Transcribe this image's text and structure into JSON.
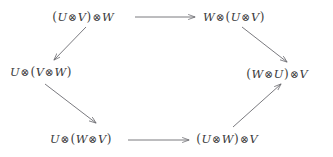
{
  "diagram": {
    "type": "commutative-hexagon",
    "title": "",
    "background_color": "#ffffff",
    "text_color": "#3a3a3c",
    "arrow_color": "#6b6b70",
    "tensor_symbol": "⊗",
    "nodes": [
      {
        "id": "top-left",
        "label": "(U⊗V)⊗W",
        "parts": [
          "(",
          "U",
          "⊗",
          "V",
          ")",
          "⊗",
          "W"
        ],
        "x": 52,
        "y": 11
      },
      {
        "id": "top-right",
        "label": "W⊗(U⊗V)",
        "parts": [
          "W",
          "⊗",
          "(",
          "U",
          "⊗",
          "V",
          ")"
        ],
        "x": 203,
        "y": 11
      },
      {
        "id": "middle-left",
        "label": "U⊗(V⊗W)",
        "parts": [
          "U",
          "⊗",
          "(",
          "V",
          "⊗",
          "W",
          ")"
        ],
        "x": 10,
        "y": 66
      },
      {
        "id": "middle-right",
        "label": "(W⊗U)⊗V",
        "parts": [
          "(",
          "W",
          "⊗",
          "U",
          ")",
          "⊗",
          "V"
        ],
        "x": 246,
        "y": 68
      },
      {
        "id": "bottom-left",
        "label": "U⊗(W⊗V)",
        "parts": [
          "U",
          "⊗",
          "(",
          "W",
          "⊗",
          "V",
          ")"
        ],
        "x": 50,
        "y": 133
      },
      {
        "id": "bottom-right",
        "label": "(U⊗W)⊗V",
        "parts": [
          "(",
          "U",
          "⊗",
          "W",
          ")",
          "⊗",
          "V"
        ],
        "x": 196,
        "y": 133
      }
    ],
    "arrows": [
      {
        "id": "arrow-top",
        "from": "top-left",
        "to": "top-right",
        "label": "",
        "x1": 135,
        "y1": 17,
        "x2": 196,
        "y2": 17
      },
      {
        "id": "arrow-top-left-down",
        "from": "top-left",
        "to": "middle-left",
        "label": "",
        "x1": 85,
        "y1": 26,
        "x2": 53,
        "y2": 60
      },
      {
        "id": "arrow-top-right-down",
        "from": "top-right",
        "to": "middle-right",
        "label": "",
        "x1": 242,
        "y1": 26,
        "x2": 288,
        "y2": 62
      },
      {
        "id": "arrow-middle-left-down",
        "from": "middle-left",
        "to": "bottom-left",
        "label": "",
        "x1": 44,
        "y1": 84,
        "x2": 96,
        "y2": 123
      },
      {
        "id": "arrow-bottom",
        "from": "bottom-left",
        "to": "bottom-right",
        "label": "",
        "x1": 128,
        "y1": 140,
        "x2": 190,
        "y2": 140
      },
      {
        "id": "arrow-bottom-right-up",
        "from": "bottom-right",
        "to": "middle-right",
        "label": "",
        "x1": 233,
        "y1": 127,
        "x2": 280,
        "y2": 85
      }
    ]
  }
}
